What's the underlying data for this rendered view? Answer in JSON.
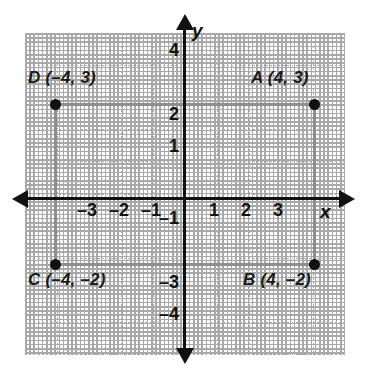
{
  "figure": {
    "type": "coordinate-plane-rectangle",
    "axis_labels": {
      "x": "x",
      "y": "y"
    },
    "x_ticks": [
      {
        "value": -3,
        "label": "–3"
      },
      {
        "value": -2,
        "label": "–2"
      },
      {
        "value": -1,
        "label": "–1"
      },
      {
        "value": 1,
        "label": "1"
      },
      {
        "value": 2,
        "label": "2"
      },
      {
        "value": 3,
        "label": "3"
      }
    ],
    "y_ticks": [
      {
        "value": 4,
        "label": "4"
      },
      {
        "value": 2,
        "label": "2"
      },
      {
        "value": 1,
        "label": "1"
      },
      {
        "value": -1,
        "label": "–1"
      },
      {
        "value": -3,
        "label": "–3"
      },
      {
        "value": -4,
        "label": "–4"
      }
    ],
    "points": [
      {
        "id": "A",
        "label": "A (4, 3)",
        "x": 4,
        "y": 3
      },
      {
        "id": "B",
        "label": "B (4, –2)",
        "x": 4,
        "y": -2
      },
      {
        "id": "C",
        "label": "C (–4, –2)",
        "x": -4,
        "y": -2
      },
      {
        "id": "D",
        "label": "D (–4, 3)",
        "x": -4,
        "y": 3
      }
    ],
    "colors": {
      "axis": "#111111",
      "grid": "#a9a9a9",
      "rectangle": "#8e8e8e",
      "point": "#111111",
      "text": "#131313",
      "background": "#ffffff"
    },
    "grid": {
      "spacing_px": 32,
      "x_range": [
        -5,
        5
      ],
      "y_range": [
        -5,
        5
      ],
      "visible": true,
      "style": "dotted"
    }
  }
}
